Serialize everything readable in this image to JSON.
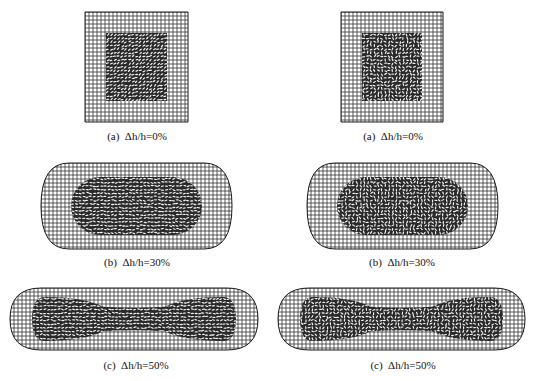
{
  "figure": {
    "columns": [
      {
        "name": "left",
        "panels": [
          {
            "id": "a",
            "label": "(a)",
            "caption": "Δh/h=0%",
            "strain_percent": 0
          },
          {
            "id": "b",
            "label": "(b)",
            "caption": "Δh/h=30%",
            "strain_percent": 30
          },
          {
            "id": "c",
            "label": "(c)",
            "caption": "Δh/h=50%",
            "strain_percent": 50
          }
        ]
      },
      {
        "name": "right",
        "panels": [
          {
            "id": "a",
            "label": "(a)",
            "caption": "Δh/h=0%",
            "strain_percent": 0
          },
          {
            "id": "b",
            "label": "(b)",
            "caption": "Δh/h=30%",
            "strain_percent": 30
          },
          {
            "id": "c",
            "label": "(c)",
            "caption": "Δh/h=50%",
            "strain_percent": 50
          }
        ]
      }
    ],
    "colors": {
      "mesh": "#1a1a1a",
      "background": "#ffffff"
    }
  }
}
